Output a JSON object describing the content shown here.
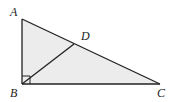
{
  "diagram": {
    "points": {
      "A": "A",
      "B": "B",
      "C": "C",
      "D": "D"
    },
    "right_angle_at": "B",
    "segments": [
      "AB",
      "BC",
      "CA",
      "BD"
    ],
    "colors": {
      "fill": "#ececec",
      "stroke": "#222222"
    }
  }
}
